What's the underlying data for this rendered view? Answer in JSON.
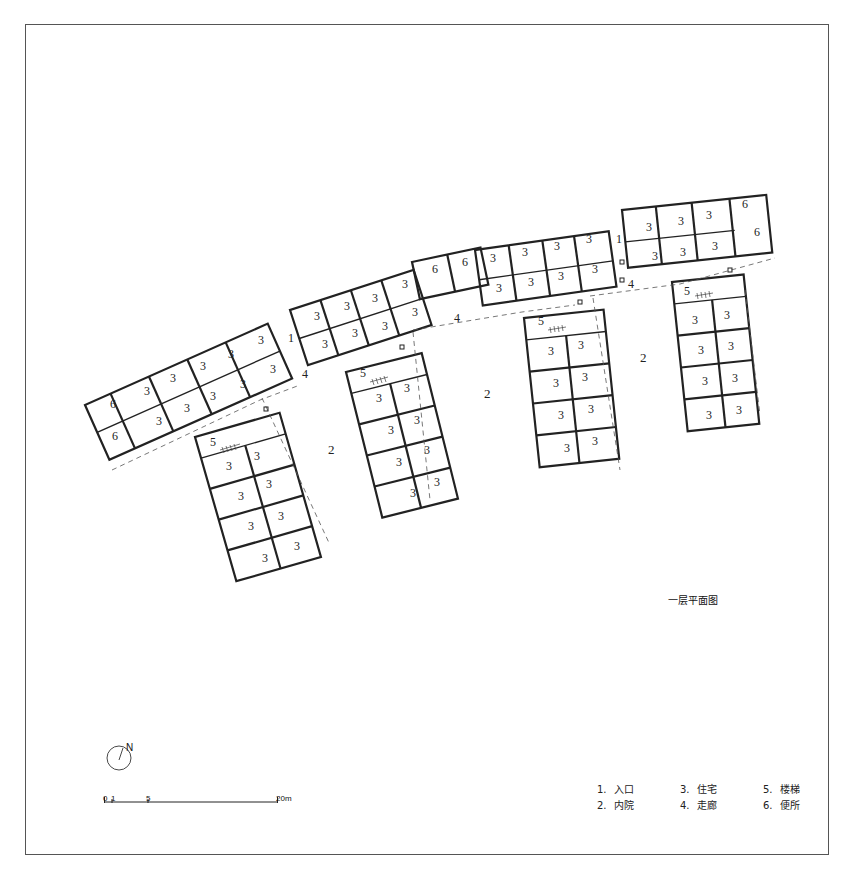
{
  "drawing": {
    "title": "一层平面图",
    "north_label": "N",
    "scale_bar": {
      "ticks": [
        "0",
        "1",
        "5",
        "20m"
      ]
    },
    "legend": [
      {
        "num": "1.",
        "label": "入口"
      },
      {
        "num": "2.",
        "label": "内院"
      },
      {
        "num": "3.",
        "label": "住宅"
      },
      {
        "num": "4.",
        "label": "走廊"
      },
      {
        "num": "5.",
        "label": "楼梯"
      },
      {
        "num": "6.",
        "label": "便所"
      }
    ],
    "plan_labels": {
      "entrance": "1",
      "courtyard": "2",
      "dwelling": "3",
      "corridor": "4",
      "stair": "5",
      "toilet": "6"
    }
  }
}
